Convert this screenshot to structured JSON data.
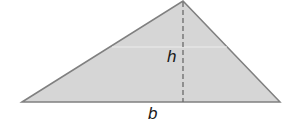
{
  "diagram": {
    "shape": "triangle",
    "fill_color": "#d4d4d4",
    "stroke_color": "#7a7a7a",
    "height_line_style": "dashed",
    "labels": {
      "height": "h",
      "base": "b"
    }
  }
}
